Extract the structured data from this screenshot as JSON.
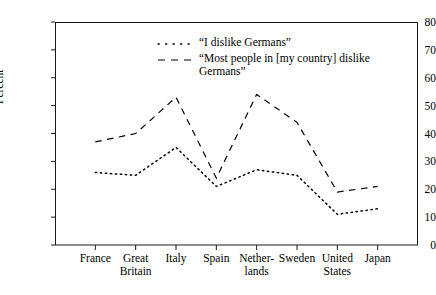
{
  "chart_data": {
    "type": "line",
    "title": "",
    "xlabel": "",
    "ylabel": "Percent",
    "ylim": [
      0,
      80
    ],
    "ytick_step": 10,
    "yticks": [
      0,
      10,
      20,
      30,
      40,
      50,
      60,
      70,
      80
    ],
    "grid": false,
    "legend_position": "top-center",
    "categories": [
      "France",
      "Great\nBritain",
      "Italy",
      "Spain",
      "Nether-\nlands",
      "Sweden",
      "United\nStates",
      "Japan"
    ],
    "series": [
      {
        "name": "“I dislike Germans”",
        "style": "dotted",
        "color": "#000000",
        "values": [
          26,
          25,
          35,
          21,
          27,
          25,
          11,
          13
        ]
      },
      {
        "name": "“Most people in [my country] dislike\nGermans”",
        "style": "dashed",
        "color": "#000000",
        "values": [
          37,
          40,
          53,
          24,
          54,
          44,
          19,
          21
        ]
      }
    ]
  },
  "axes": {
    "y_title": "Percent",
    "y_labels": [
      "80",
      "70",
      "60",
      "50",
      "40",
      "30",
      "20",
      "10",
      "0"
    ]
  },
  "legend": {
    "entries": [
      {
        "label": "“I dislike Germans”",
        "marker": "dotted-line-marker"
      },
      {
        "label": "“Most people in [my country] dislike\nGermans”",
        "marker": "dashed-line-marker"
      }
    ]
  }
}
